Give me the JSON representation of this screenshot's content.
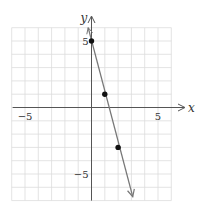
{
  "chart_data": {
    "type": "line",
    "title": "",
    "xlabel": "x",
    "ylabel": "y",
    "xlim": [
      -6,
      6
    ],
    "ylim": [
      -7,
      6
    ],
    "grid": true,
    "x_tick_labels": [
      {
        "value": -5,
        "label": "−5"
      },
      {
        "value": 5,
        "label": "5"
      }
    ],
    "y_tick_labels": [
      {
        "value": 5,
        "label": "5"
      },
      {
        "value": -5,
        "label": "−5"
      }
    ],
    "series": [
      {
        "name": "y = -4x + 5",
        "equation": "y = -4x + 5",
        "slope": -4,
        "intercept": 5,
        "line_from": [
          0.2,
          5.8
        ],
        "line_to": [
          3.1,
          -6.7
        ],
        "points": [
          [
            0,
            5
          ],
          [
            1,
            1
          ],
          [
            2,
            -3
          ]
        ]
      }
    ]
  },
  "colors": {
    "grid": "#dcdcdc",
    "axis": "#555555",
    "line": "#777777",
    "point": "#111111",
    "text": "#333333"
  }
}
